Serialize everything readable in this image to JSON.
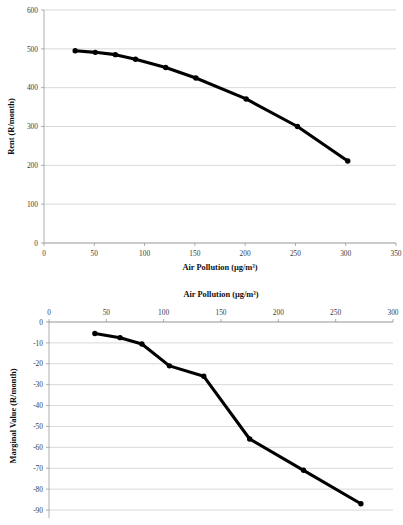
{
  "page": {
    "background_color": "#ffffff",
    "line_color": "#000000",
    "grid_color": "#bfbfbf",
    "axis_color": "#8c8c8c",
    "text_color": "#1a1a1a"
  },
  "chart_data": [
    {
      "id": "rent-vs-pollution",
      "type": "line",
      "title": "",
      "xlabel": "Air Pollution (µg/m³)",
      "ylabel": "Rent (R/month)",
      "xlim": [
        0,
        350
      ],
      "ylim": [
        0,
        600
      ],
      "xticks": [
        0,
        50,
        100,
        150,
        200,
        250,
        300,
        350
      ],
      "xtick_labels": [
        "0",
        "50",
        "100",
        "150",
        "200",
        "250",
        "300",
        "350"
      ],
      "yticks": [
        0,
        100,
        200,
        300,
        400,
        500,
        600
      ],
      "ytick_labels": [
        "0",
        "100",
        "200",
        "300",
        "400",
        "500",
        "600"
      ],
      "grid": "horizontal",
      "xaxis_position": "bottom",
      "legend": "none",
      "markers": "filled-circle",
      "x": [
        31,
        51,
        71,
        91,
        121,
        151,
        201,
        252,
        302
      ],
      "values": [
        495,
        491,
        485,
        473,
        452,
        425,
        371,
        300,
        211
      ]
    },
    {
      "id": "marginal-value-vs-pollution",
      "type": "line",
      "title": "",
      "xlabel": "Air Pollution (µg/m³)",
      "ylabel": "Marginal Value (R/month)",
      "xlim": [
        0,
        300
      ],
      "ylim": [
        -90,
        0
      ],
      "xticks": [
        0,
        50,
        100,
        150,
        200,
        250,
        300
      ],
      "xtick_labels": [
        "0",
        "50",
        "100",
        "150",
        "200",
        "250",
        "300"
      ],
      "yticks": [
        0,
        -10,
        -20,
        -30,
        -40,
        -50,
        -60,
        -70,
        -80,
        -90
      ],
      "ytick_labels": [
        "0",
        "-10",
        "-20",
        "-30",
        "-40",
        "-50",
        "-60",
        "-70",
        "-80",
        "-90"
      ],
      "grid": "horizontal",
      "xaxis_position": "top",
      "legend": "none",
      "markers": "filled-circle",
      "x": [
        40,
        62,
        81,
        105,
        135,
        175,
        222,
        272
      ],
      "values": [
        -5.5,
        -7.5,
        -10.5,
        -21,
        -26,
        -56,
        -71,
        -87
      ]
    }
  ]
}
